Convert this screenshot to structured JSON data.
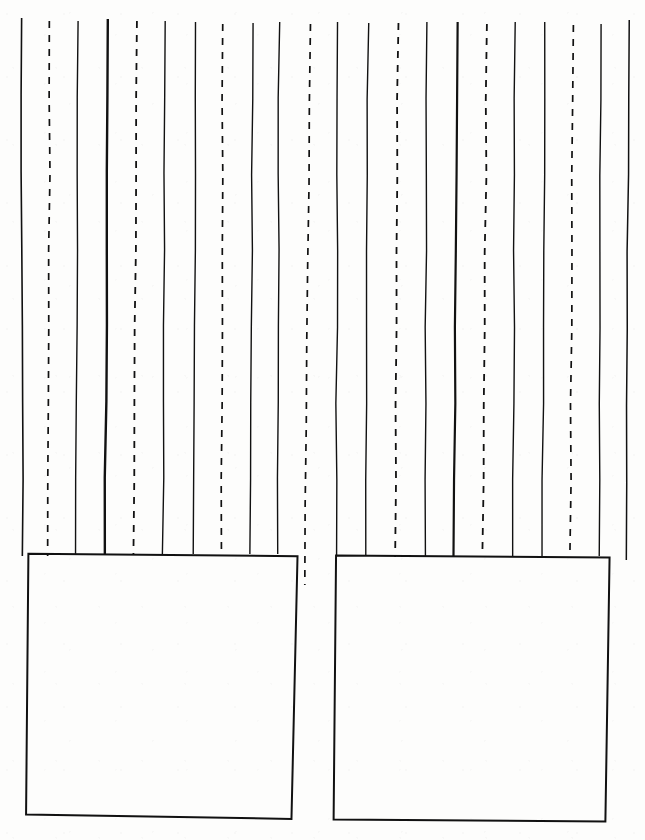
{
  "page": {
    "width": 645,
    "height": 840,
    "background_color": "#fdfdfc",
    "ink_color": "#111111",
    "style": "hand-drawn ink on paper, no text labels"
  },
  "figure": {
    "line_count": 22,
    "solid_line_count": 14,
    "dashed_line_count": 8,
    "box_count": 2
  },
  "chart_data": {
    "type": "line",
    "title": "",
    "subtitle": "",
    "xlabel": "",
    "ylabel": "",
    "grid": false,
    "legend": null,
    "xlim": [
      0,
      645
    ],
    "ylim": [
      0,
      840
    ],
    "lines": [
      {
        "id": 1,
        "style": "solid",
        "weight": 1.6,
        "x_top": 21,
        "y_top": 18,
        "x_bottom": 23,
        "y_bottom": 556
      },
      {
        "id": 2,
        "style": "dashed",
        "weight": 1.7,
        "x_top": 50,
        "y_top": 21,
        "x_bottom": 48,
        "y_bottom": 556
      },
      {
        "id": 3,
        "style": "solid",
        "weight": 1.4,
        "x_top": 78,
        "y_top": 21,
        "x_bottom": 76,
        "y_bottom": 554
      },
      {
        "id": 4,
        "style": "solid",
        "weight": 2.4,
        "x_top": 108,
        "y_top": 19,
        "x_bottom": 105,
        "y_bottom": 554
      },
      {
        "id": 5,
        "style": "dashed",
        "weight": 1.8,
        "x_top": 137,
        "y_top": 21,
        "x_bottom": 134,
        "y_bottom": 555
      },
      {
        "id": 6,
        "style": "solid",
        "weight": 1.4,
        "x_top": 165,
        "y_top": 21,
        "x_bottom": 163,
        "y_bottom": 554
      },
      {
        "id": 7,
        "style": "solid",
        "weight": 1.4,
        "x_top": 196,
        "y_top": 22,
        "x_bottom": 193,
        "y_bottom": 554
      },
      {
        "id": 8,
        "style": "dashed",
        "weight": 1.7,
        "x_top": 223,
        "y_top": 24,
        "x_bottom": 221,
        "y_bottom": 555
      },
      {
        "id": 9,
        "style": "solid",
        "weight": 1.4,
        "x_top": 253,
        "y_top": 23,
        "x_bottom": 250,
        "y_bottom": 554
      },
      {
        "id": 10,
        "style": "solid",
        "weight": 1.4,
        "x_top": 279,
        "y_top": 22,
        "x_bottom": 278,
        "y_bottom": 554
      },
      {
        "id": 11,
        "style": "dashed",
        "weight": 1.7,
        "x_top": 310,
        "y_top": 24,
        "x_bottom": 305,
        "y_bottom": 585
      },
      {
        "id": 12,
        "style": "solid",
        "weight": 1.4,
        "x_top": 338,
        "y_top": 22,
        "x_bottom": 336,
        "y_bottom": 556
      },
      {
        "id": 13,
        "style": "solid",
        "weight": 1.4,
        "x_top": 368,
        "y_top": 23,
        "x_bottom": 366,
        "y_bottom": 556
      },
      {
        "id": 14,
        "style": "dashed",
        "weight": 1.8,
        "x_top": 398,
        "y_top": 23,
        "x_bottom": 395,
        "y_bottom": 557
      },
      {
        "id": 15,
        "style": "solid",
        "weight": 1.4,
        "x_top": 427,
        "y_top": 22,
        "x_bottom": 425,
        "y_bottom": 556
      },
      {
        "id": 16,
        "style": "solid",
        "weight": 2.2,
        "x_top": 457,
        "y_top": 22,
        "x_bottom": 454,
        "y_bottom": 556
      },
      {
        "id": 17,
        "style": "dashed",
        "weight": 1.8,
        "x_top": 487,
        "y_top": 24,
        "x_bottom": 483,
        "y_bottom": 557
      },
      {
        "id": 18,
        "style": "solid",
        "weight": 1.4,
        "x_top": 515,
        "y_top": 22,
        "x_bottom": 513,
        "y_bottom": 556
      },
      {
        "id": 19,
        "style": "solid",
        "weight": 1.4,
        "x_top": 545,
        "y_top": 22,
        "x_bottom": 542,
        "y_bottom": 556
      },
      {
        "id": 20,
        "style": "dashed",
        "weight": 1.7,
        "x_top": 573,
        "y_top": 25,
        "x_bottom": 570,
        "y_bottom": 556
      },
      {
        "id": 21,
        "style": "solid",
        "weight": 1.4,
        "x_top": 601,
        "y_top": 24,
        "x_bottom": 599,
        "y_bottom": 556
      },
      {
        "id": 22,
        "style": "solid",
        "weight": 1.5,
        "x_top": 629,
        "y_top": 20,
        "x_bottom": 626,
        "y_bottom": 560
      }
    ],
    "boxes": [
      {
        "id": "left-box",
        "label": "",
        "corners": [
          {
            "x": 29,
            "y": 554
          },
          {
            "x": 297,
            "y": 556
          },
          {
            "x": 292,
            "y": 819
          },
          {
            "x": 26,
            "y": 815
          }
        ],
        "weight": 2.0
      },
      {
        "id": "right-box",
        "label": "",
        "corners": [
          {
            "x": 336,
            "y": 556
          },
          {
            "x": 609,
            "y": 557
          },
          {
            "x": 605,
            "y": 821
          },
          {
            "x": 334,
            "y": 820
          }
        ],
        "weight": 2.0
      }
    ]
  },
  "dash_pattern": {
    "dash": 7,
    "gap": 7
  }
}
